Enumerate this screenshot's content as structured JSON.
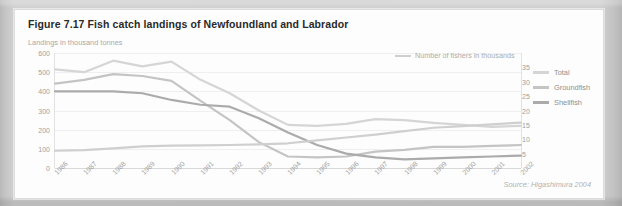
{
  "figure": {
    "title": "Figure 7.17 Fish catch landings of Newfoundland and Labrador",
    "source": "Source: Higashimura 2004"
  },
  "annotation": {
    "fishers_label": "Number of fishers in thousands"
  },
  "legend": {
    "items": [
      {
        "label": "Total",
        "color": "#d5d5d5"
      },
      {
        "label": "Groundfish",
        "color": "#c4c4c4"
      },
      {
        "label": "Shellfish",
        "color": "#ababab"
      }
    ]
  },
  "chart_data": {
    "type": "line",
    "title": "Figure 7.17 Fish catch landings of Newfoundland and Labrador",
    "xlabel": "",
    "ylabel": "Landings in thousand tonnes",
    "y2label": "Number of fishers in thousands",
    "grid": true,
    "legend_position": "right",
    "x": [
      1986,
      1987,
      1988,
      1989,
      1990,
      1991,
      1992,
      1993,
      1994,
      1995,
      1996,
      1997,
      1998,
      1999,
      2000,
      2001,
      2002
    ],
    "xtick_labels": [
      "1986",
      "1987",
      "1988",
      "1989",
      "1990",
      "1991",
      "1992",
      "1993",
      "1994",
      "1995",
      "1996",
      "1997",
      "1998",
      "1999",
      "2000",
      "2001",
      "2002"
    ],
    "ylim": [
      0,
      600
    ],
    "ytick_labels": [
      "600",
      "500",
      "400",
      "300",
      "200",
      "100",
      "0"
    ],
    "ytick_values": [
      600,
      500,
      400,
      300,
      200,
      100,
      0
    ],
    "y2lim": [
      0,
      40
    ],
    "y2tick_labels": [
      "35",
      "30",
      "25",
      "20",
      "15",
      "10",
      "5"
    ],
    "y2tick_values": [
      35,
      30,
      25,
      20,
      15,
      10,
      5
    ],
    "series": [
      {
        "name": "Total",
        "axis": "left",
        "color": "#d5d5d5",
        "values": [
          515,
          500,
          560,
          530,
          555,
          460,
          390,
          300,
          225,
          220,
          230,
          255,
          250,
          235,
          225,
          215,
          220
        ]
      },
      {
        "name": "Groundfish",
        "axis": "left",
        "color": "#c4c4c4",
        "values": [
          440,
          460,
          490,
          480,
          455,
          350,
          250,
          135,
          60,
          55,
          60,
          85,
          95,
          110,
          110,
          115,
          120
        ]
      },
      {
        "name": "Shellfish",
        "axis": "left",
        "color": "#ababab",
        "values": [
          400,
          400,
          400,
          390,
          355,
          330,
          320,
          260,
          185,
          120,
          75,
          55,
          45,
          50,
          55,
          60,
          65
        ]
      },
      {
        "name": "Number of fishers in thousands",
        "axis": "right",
        "color": "#cfcfcf",
        "values": [
          6.0,
          6.2,
          6.8,
          7.5,
          7.8,
          7.9,
          8.0,
          8.2,
          8.6,
          9.6,
          10.6,
          11.6,
          12.8,
          14.0,
          14.6,
          15.2,
          15.8
        ]
      }
    ]
  }
}
